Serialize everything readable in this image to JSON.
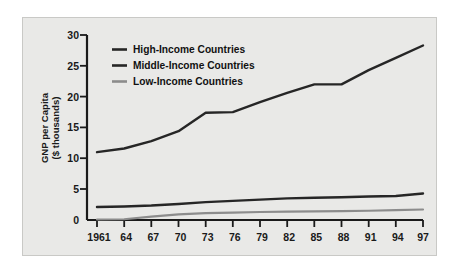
{
  "chart_data": {
    "type": "line",
    "title": "",
    "xlabel": "",
    "ylabel": "GNP per Capita ($ thousands)",
    "ylabel_line1": "GNP per Capita",
    "ylabel_line2": "($ thousands)",
    "grid": false,
    "legend_position": "top-left inside",
    "xlim": [
      1961,
      1997
    ],
    "ylim": [
      0,
      30
    ],
    "yticks": [
      0,
      5,
      10,
      15,
      20,
      25,
      30
    ],
    "ytick_labels": [
      "0",
      "5",
      "10",
      "15",
      "20",
      "25",
      "30"
    ],
    "x": [
      1961,
      1964,
      1967,
      1970,
      1973,
      1976,
      1979,
      1982,
      1985,
      1988,
      1991,
      1994,
      1997
    ],
    "xtick_labels": [
      "1961",
      "64",
      "67",
      "70",
      "73",
      "76",
      "79",
      "82",
      "85",
      "88",
      "91",
      "94",
      "97"
    ],
    "series": [
      {
        "name": "High-Income Countries",
        "color": "#262626",
        "values": [
          11.0,
          11.6,
          12.8,
          14.4,
          17.4,
          17.5,
          19.1,
          20.6,
          22.0,
          22.0,
          24.3,
          26.3,
          28.3
        ]
      },
      {
        "name": "Middle-Income Countries",
        "color": "#262626",
        "values": [
          2.1,
          2.2,
          2.35,
          2.6,
          2.9,
          3.1,
          3.3,
          3.5,
          3.6,
          3.7,
          3.8,
          3.9,
          4.3
        ]
      },
      {
        "name": "Low-Income Countries",
        "color": "#8c8c8c",
        "values": [
          0.08,
          0.12,
          0.55,
          0.9,
          1.1,
          1.2,
          1.3,
          1.35,
          1.4,
          1.45,
          1.5,
          1.6,
          1.7
        ]
      }
    ]
  },
  "legend": {
    "items": [
      {
        "label": "High-Income Countries",
        "color": "#262626"
      },
      {
        "label": "Middle-Income Countries",
        "color": "#262626"
      },
      {
        "label": "Low-Income Countries",
        "color": "#8c8c8c"
      }
    ]
  }
}
